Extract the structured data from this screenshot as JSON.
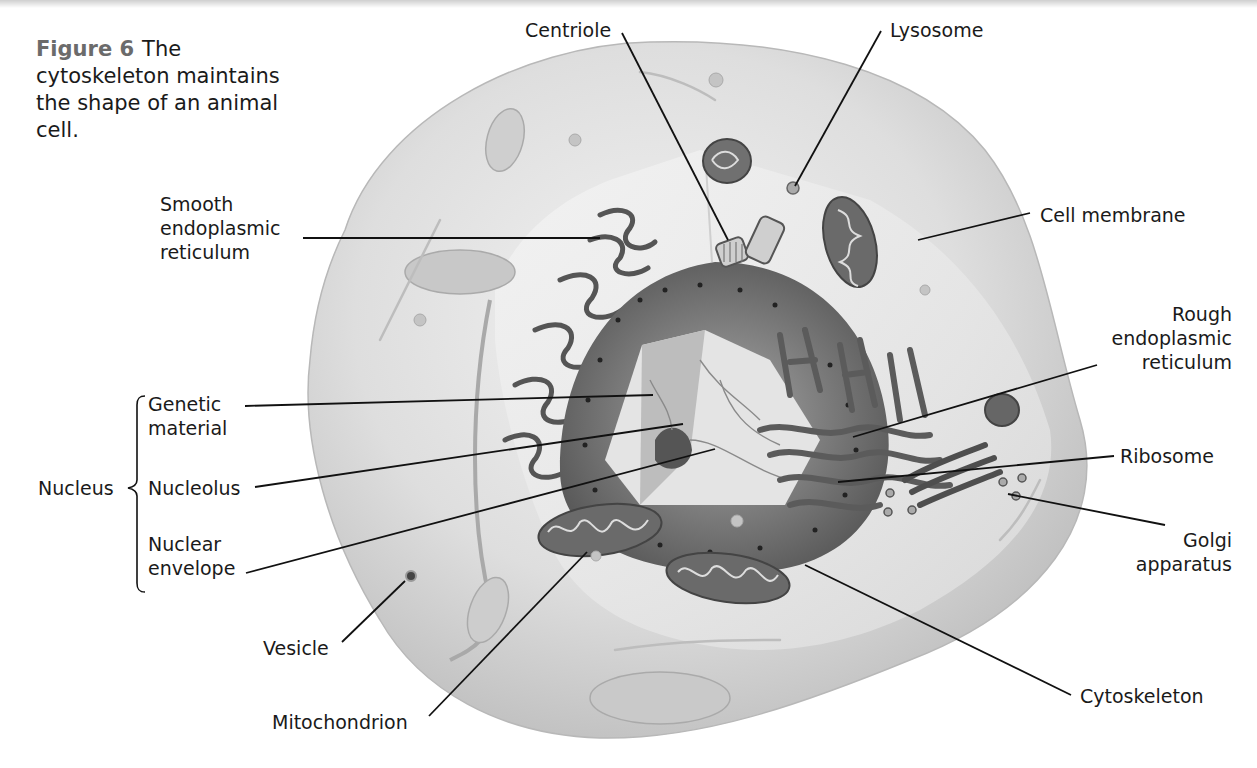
{
  "figure": {
    "number": "Figure 6",
    "caption": "The cytoskeleton maintains the shape of an animal cell."
  },
  "labels": {
    "centriole": "Centriole",
    "lysosome": "Lysosome",
    "smooth_er": [
      "Smooth",
      "endoplasmic",
      "reticulum"
    ],
    "cell_membrane": "Cell membrane",
    "rough_er": [
      "Rough",
      "endoplasmic",
      "reticulum"
    ],
    "nucleus_group": {
      "title": "Nucleus",
      "genetic_material": [
        "Genetic",
        "material"
      ],
      "nucleolus": "Nucleolus",
      "nuclear_envelope": [
        "Nuclear",
        "envelope"
      ]
    },
    "ribosome": "Ribosome",
    "golgi": [
      "Golgi",
      "apparatus"
    ],
    "vesicle": "Vesicle",
    "mitochondrion": "Mitochondrion",
    "cytoskeleton": "Cytoskeleton"
  },
  "colors": {
    "cell_fill": "#d9d9d9",
    "cytoplasm_light": "#ececec",
    "nucleus_dark": "#6f6f6f",
    "leader_line": "#111111",
    "figure_label": "#6b6b6b"
  }
}
